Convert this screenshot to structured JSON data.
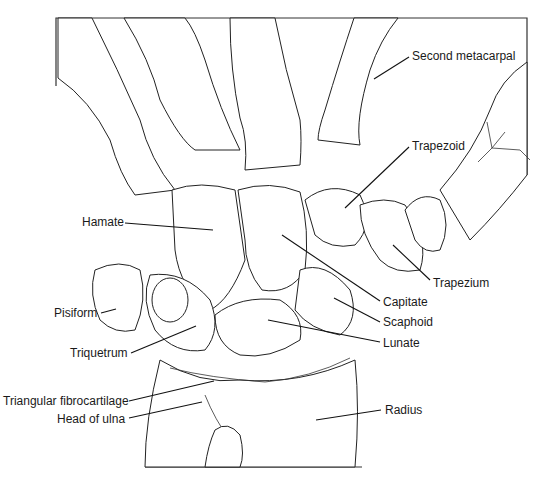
{
  "figure": {
    "stroke_color": "#222222",
    "background": "#ffffff"
  },
  "labels": [
    {
      "id": "second-metacarpal",
      "text": "Second metacarpal",
      "x": 412,
      "y": 49,
      "lx1": 409,
      "ly1": 57,
      "lx2": 374,
      "ly2": 79
    },
    {
      "id": "trapezoid",
      "text": "Trapezoid",
      "x": 412,
      "y": 139,
      "lx1": 409,
      "ly1": 147,
      "lx2": 345,
      "ly2": 208
    },
    {
      "id": "hamate",
      "text": "Hamate",
      "x": 82,
      "y": 215,
      "lx1": 125,
      "ly1": 223,
      "lx2": 213,
      "ly2": 230
    },
    {
      "id": "trapezium",
      "text": "Trapezium",
      "x": 433,
      "y": 276,
      "lx1": 430,
      "ly1": 280,
      "lx2": 393,
      "ly2": 245
    },
    {
      "id": "capitate",
      "text": "Capitate",
      "x": 383,
      "y": 295,
      "lx1": 380,
      "ly1": 301,
      "lx2": 282,
      "ly2": 235
    },
    {
      "id": "scaphoid",
      "text": "Scaphoid",
      "x": 383,
      "y": 315,
      "lx1": 380,
      "ly1": 322,
      "lx2": 334,
      "ly2": 298
    },
    {
      "id": "pisiform",
      "text": "Pisiform",
      "x": 54,
      "y": 306,
      "lx1": 101,
      "ly1": 313,
      "lx2": 116,
      "ly2": 309
    },
    {
      "id": "lunate",
      "text": "Lunate",
      "x": 383,
      "y": 336,
      "lx1": 380,
      "ly1": 342,
      "lx2": 268,
      "ly2": 320
    },
    {
      "id": "triquetrum",
      "text": "Triquetrum",
      "x": 70,
      "y": 346,
      "lx1": 131,
      "ly1": 353,
      "lx2": 196,
      "ly2": 326
    },
    {
      "id": "triangular-fibrocartilage",
      "text": "Triangular fibrocartilage",
      "x": 3,
      "y": 394,
      "lx1": 129,
      "ly1": 401,
      "lx2": 214,
      "ly2": 381
    },
    {
      "id": "head-of-ulna",
      "text": "Head of ulna",
      "x": 57,
      "y": 412,
      "lx1": 129,
      "ly1": 418,
      "lx2": 202,
      "ly2": 402
    },
    {
      "id": "radius",
      "text": "Radius",
      "x": 385,
      "y": 403,
      "lx1": 381,
      "ly1": 410,
      "lx2": 316,
      "ly2": 420
    }
  ]
}
